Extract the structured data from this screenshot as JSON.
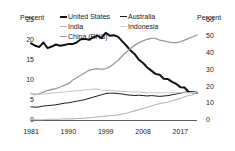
{
  "chart_data": {
    "type": "line",
    "title": "",
    "xlabel": "",
    "ylabel": "Percent",
    "y2label": "Percent",
    "xlim": [
      1981,
      2021
    ],
    "ylim": [
      0,
      25
    ],
    "y2lim": [
      0,
      60
    ],
    "grid": false,
    "legend_position": "top-center",
    "xticks": [
      "1981",
      "1990",
      "1999",
      "2008",
      "2017"
    ],
    "xtick_values": [
      1981,
      1990,
      1999,
      2008,
      2017
    ],
    "yticks_left": [
      "0",
      "5",
      "10",
      "15",
      "20",
      "25"
    ],
    "ytick_left_values": [
      0,
      5,
      10,
      15,
      20,
      25
    ],
    "yticks_right": [
      "0",
      "10",
      "20",
      "30",
      "40",
      "50",
      "60"
    ],
    "ytick_right_values": [
      0,
      10,
      20,
      30,
      40,
      50,
      60
    ],
    "x": [
      1981,
      1982,
      1983,
      1984,
      1985,
      1986,
      1987,
      1988,
      1989,
      1990,
      1991,
      1992,
      1993,
      1994,
      1995,
      1996,
      1997,
      1998,
      1999,
      2000,
      2001,
      2002,
      2003,
      2004,
      2005,
      2006,
      2007,
      2008,
      2009,
      2010,
      2011,
      2012,
      2013,
      2014,
      2015,
      2016,
      2017,
      2018,
      2019,
      2020,
      2021
    ],
    "series": [
      {
        "name": "United States",
        "axis": "left",
        "color": "#111111",
        "width": 2.0,
        "values": [
          19.2,
          18.6,
          18.3,
          19.4,
          18.0,
          18.4,
          18.9,
          18.6,
          18.8,
          19.0,
          19.0,
          19.4,
          20.2,
          20.3,
          20.1,
          20.6,
          21.1,
          20.5,
          21.8,
          21.1,
          21.2,
          20.8,
          19.7,
          18.6,
          17.4,
          16.5,
          15.1,
          14.3,
          13.2,
          12.4,
          11.6,
          11.4,
          10.4,
          10.3,
          9.6,
          9.1,
          8.3,
          8.2,
          7.1,
          7.0,
          6.9
        ]
      },
      {
        "name": "India",
        "axis": "left",
        "color": "#b8b8b8",
        "width": 1.1,
        "values": [
          0.2,
          0.2,
          0.2,
          0.2,
          0.3,
          0.3,
          0.3,
          0.3,
          0.4,
          0.4,
          0.4,
          0.5,
          0.5,
          0.6,
          0.7,
          0.8,
          0.9,
          1.0,
          1.1,
          1.2,
          1.3,
          1.4,
          1.6,
          1.8,
          2.1,
          2.4,
          2.7,
          3.0,
          3.3,
          3.6,
          3.9,
          4.2,
          4.4,
          4.6,
          4.9,
          5.2,
          5.5,
          5.9,
          6.2,
          6.4,
          7.0
        ]
      },
      {
        "name": "China (RHS)",
        "axis": "right",
        "color": "#9a9a9a",
        "width": 1.3,
        "values": [
          16.0,
          15.5,
          16.0,
          17.0,
          18.0,
          18.5,
          19.0,
          20.0,
          21.0,
          22.0,
          24.0,
          25.5,
          27.0,
          28.5,
          30.0,
          30.5,
          31.0,
          30.5,
          31.0,
          32.0,
          34.0,
          36.0,
          38.5,
          41.0,
          43.0,
          45.0,
          46.5,
          47.5,
          48.5,
          49.0,
          49.0,
          48.0,
          47.5,
          47.0,
          46.5,
          46.5,
          47.0,
          48.0,
          49.0,
          50.0,
          51.0
        ]
      },
      {
        "name": "Australia",
        "axis": "left",
        "color": "#1a1a1a",
        "width": 1.0,
        "values": [
          3.4,
          3.3,
          3.4,
          3.6,
          3.7,
          3.8,
          3.9,
          4.1,
          4.3,
          4.4,
          4.6,
          4.8,
          5.0,
          5.2,
          5.5,
          5.8,
          6.1,
          6.4,
          6.7,
          6.8,
          6.8,
          6.7,
          6.6,
          6.4,
          6.3,
          6.2,
          6.3,
          6.2,
          6.1,
          6.2,
          6.1,
          6.0,
          6.1,
          6.2,
          6.4,
          6.6,
          6.8,
          7.0,
          7.2,
          7.1,
          7.0
        ]
      },
      {
        "name": "Indonesia",
        "axis": "left",
        "color": "#c9c9c9",
        "width": 1.1,
        "values": [
          6.8,
          6.6,
          6.5,
          6.6,
          6.7,
          6.8,
          6.9,
          7.0,
          7.1,
          7.2,
          7.3,
          7.4,
          7.5,
          7.6,
          7.7,
          7.8,
          7.8,
          7.6,
          7.5,
          7.5,
          7.4,
          7.3,
          7.2,
          7.2,
          7.1,
          7.1,
          7.1,
          7.0,
          6.9,
          6.9,
          6.9,
          6.9,
          6.9,
          6.9,
          6.9,
          6.9,
          6.9,
          6.9,
          6.9,
          7.0,
          7.0
        ]
      }
    ]
  },
  "axes": {
    "left_title": "Percent",
    "right_title": "Percent"
  },
  "legend": {
    "columns": [
      [
        {
          "label": "United States",
          "color": "#111111",
          "width": 2.0
        },
        {
          "label": "India",
          "color": "#b8b8b8",
          "width": 1.1
        },
        {
          "label": "China (RHS)",
          "color": "#9a9a9a",
          "width": 1.3
        }
      ],
      [
        {
          "label": "Australia",
          "color": "#1a1a1a",
          "width": 1.0
        },
        {
          "label": "Indonesia",
          "color": "#c9c9c9",
          "width": 1.1
        }
      ]
    ]
  },
  "colors": {
    "axis": "#333333",
    "text": "#1a1a1a",
    "background": "#ffffff"
  }
}
